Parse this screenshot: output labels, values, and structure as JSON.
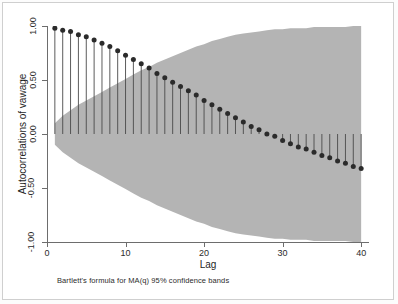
{
  "chart_data": {
    "type": "bar",
    "subtype": "stem-acf",
    "title": "",
    "xlabel": "Lag",
    "ylabel": "Autocorrelations of vawage",
    "note": "Bartlett's formula for MA(q) 95% confidence bands",
    "xlim": [
      0,
      41
    ],
    "ylim": [
      -1.0,
      1.0
    ],
    "xticks": [
      0,
      10,
      20,
      30,
      40
    ],
    "xticklabels": [
      "0",
      "10",
      "20",
      "30",
      "40"
    ],
    "yticks": [
      1.0,
      0.5,
      0.0,
      -0.5,
      -1.0
    ],
    "yticklabels": [
      "1.00",
      "0.50",
      "0.00",
      "-0.50",
      "-1.00"
    ],
    "grid": false,
    "legend": false,
    "marker_color": "#2b2b2b",
    "stem_color": "#4a4a4a",
    "band_color": "#b4b4b4",
    "axis_color": "#6d6d6d",
    "categories": [
      1,
      2,
      3,
      4,
      5,
      6,
      7,
      8,
      9,
      10,
      11,
      12,
      13,
      14,
      15,
      16,
      17,
      18,
      19,
      20,
      21,
      22,
      23,
      24,
      25,
      26,
      27,
      28,
      29,
      30,
      31,
      32,
      33,
      34,
      35,
      36,
      37,
      38,
      39,
      40
    ],
    "values": [
      0.98,
      0.96,
      0.95,
      0.92,
      0.9,
      0.87,
      0.84,
      0.81,
      0.77,
      0.73,
      0.69,
      0.65,
      0.61,
      0.56,
      0.52,
      0.48,
      0.44,
      0.4,
      0.36,
      0.31,
      0.27,
      0.23,
      0.19,
      0.15,
      0.11,
      0.07,
      0.04,
      0.0,
      -0.02,
      -0.06,
      -0.09,
      -0.12,
      -0.14,
      -0.17,
      -0.2,
      -0.22,
      -0.25,
      -0.27,
      -0.3,
      -0.32
    ],
    "confidence_upper": [
      0.1,
      0.17,
      0.22,
      0.27,
      0.31,
      0.35,
      0.39,
      0.43,
      0.47,
      0.51,
      0.55,
      0.59,
      0.62,
      0.66,
      0.69,
      0.72,
      0.75,
      0.78,
      0.81,
      0.83,
      0.86,
      0.88,
      0.9,
      0.92,
      0.93,
      0.94,
      0.95,
      0.96,
      0.97,
      0.97,
      0.98,
      0.98,
      0.98,
      0.99,
      0.99,
      0.99,
      0.99,
      0.99,
      1.0,
      1.0
    ],
    "confidence_lower": [
      -0.1,
      -0.17,
      -0.22,
      -0.27,
      -0.31,
      -0.35,
      -0.39,
      -0.43,
      -0.47,
      -0.51,
      -0.55,
      -0.59,
      -0.62,
      -0.66,
      -0.69,
      -0.72,
      -0.75,
      -0.78,
      -0.81,
      -0.83,
      -0.86,
      -0.88,
      -0.9,
      -0.92,
      -0.93,
      -0.94,
      -0.95,
      -0.96,
      -0.97,
      -0.97,
      -0.98,
      -0.98,
      -0.98,
      -0.99,
      -0.99,
      -0.99,
      -0.99,
      -0.99,
      -1.0,
      -1.0
    ]
  }
}
